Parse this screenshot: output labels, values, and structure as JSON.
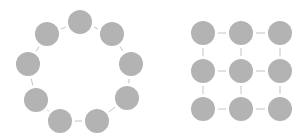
{
  "colors": {
    "node_fill": "#b3b3b3",
    "edge": "#c4c4c4",
    "background": "#ffffff"
  },
  "node_radius": 12,
  "ring": {
    "label": "ring-topology",
    "nodes": [
      {
        "x": 80,
        "y": 22
      },
      {
        "x": 112,
        "y": 34
      },
      {
        "x": 131,
        "y": 64
      },
      {
        "x": 127,
        "y": 98
      },
      {
        "x": 97,
        "y": 121
      },
      {
        "x": 60,
        "y": 121
      },
      {
        "x": 36,
        "y": 100
      },
      {
        "x": 28,
        "y": 64
      },
      {
        "x": 47,
        "y": 34
      }
    ]
  },
  "grid": {
    "label": "mesh-grid-topology",
    "cols": [
      203,
      241,
      280
    ],
    "rows": [
      33,
      71,
      109
    ]
  }
}
